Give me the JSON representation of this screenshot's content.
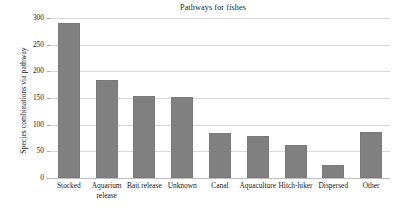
{
  "chart_data": {
    "type": "bar",
    "title": "Pathways for fishes",
    "xlabel": "",
    "ylabel": "Species combinations via pathway",
    "categories": [
      "Stocked",
      "Aquarium release",
      "Bait release",
      "Unknown",
      "Canal",
      "Aquaculture",
      "Hitch-hiker",
      "Dispersed",
      "Other"
    ],
    "values": [
      290,
      183,
      154,
      152,
      84,
      79,
      61,
      24,
      87
    ],
    "ylim": [
      0,
      300
    ],
    "ytick_labels": [
      "300",
      "250",
      "200",
      "150",
      "100",
      "50",
      "0"
    ],
    "ytick_values": [
      300,
      250,
      200,
      150,
      100,
      50,
      0
    ],
    "grid": true,
    "legend": "none",
    "bar_color": "#808080",
    "grid_color": "#d9d9d9",
    "axis_color": "#bdbdbd",
    "text_color": "#1a1a1a"
  }
}
